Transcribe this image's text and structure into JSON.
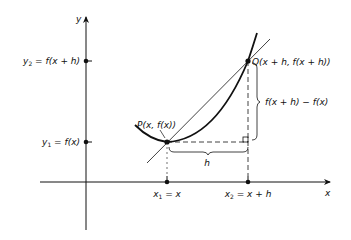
{
  "diagram": {
    "axes": {
      "x_label": "x",
      "y_label": "y"
    },
    "y_ticks": [
      {
        "label_main": "y",
        "label_sub": "2",
        "label_rest": " = f(x + h)"
      },
      {
        "label_main": "y",
        "label_sub": "1",
        "label_rest": " = f(x)"
      }
    ],
    "x_ticks": [
      {
        "label_main": "x",
        "label_sub": "1",
        "label_rest": " = x"
      },
      {
        "label_main": "x",
        "label_sub": "2",
        "label_rest": " = x + h"
      }
    ],
    "points": {
      "P": "P(x, f(x))",
      "Q": "Q(x + h, f(x + h))"
    },
    "brace_labels": {
      "horizontal": "h",
      "vertical": "f(x + h) − f(x)"
    },
    "colors": {
      "ink": "#111111",
      "background": "#ffffff"
    }
  }
}
